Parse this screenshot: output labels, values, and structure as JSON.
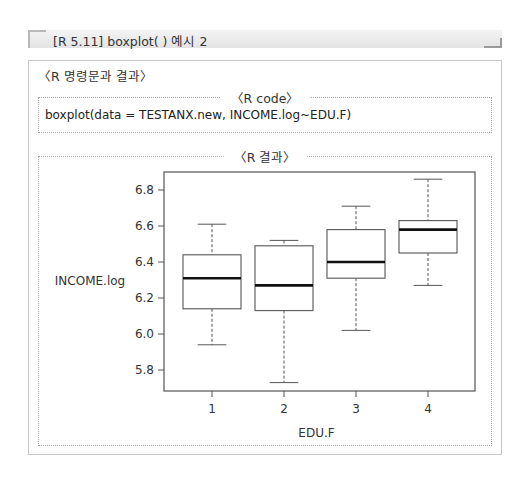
{
  "header": {
    "title": "[R 5.11] boxplot( ) 예시 2"
  },
  "panel": {
    "section_label": "〈R 명령문과 결과〉",
    "code_section": {
      "legend": "〈R code〉",
      "code": "boxplot(data = TESTANX.new, INCOME.log~EDU.F)"
    },
    "result_section": {
      "legend": "〈R 결과〉"
    }
  },
  "chart_data": {
    "type": "boxplot",
    "title": "",
    "xlabel": "EDU.F",
    "ylabel": "INCOME.log",
    "categories": [
      "1",
      "2",
      "3",
      "4"
    ],
    "yticks": [
      "5.8",
      "6.0",
      "6.2",
      "6.4",
      "6.6",
      "6.8"
    ],
    "ylim": [
      5.7,
      6.9
    ],
    "grid": false,
    "boxes": [
      {
        "category": "1",
        "whisker_low": 5.94,
        "q1": 6.14,
        "median": 6.31,
        "q3": 6.44,
        "whisker_high": 6.61
      },
      {
        "category": "2",
        "whisker_low": 5.73,
        "q1": 6.13,
        "median": 6.27,
        "q3": 6.49,
        "whisker_high": 6.52
      },
      {
        "category": "3",
        "whisker_low": 6.02,
        "q1": 6.31,
        "median": 6.4,
        "q3": 6.58,
        "whisker_high": 6.71
      },
      {
        "category": "4",
        "whisker_low": 6.27,
        "q1": 6.45,
        "median": 6.58,
        "q3": 6.63,
        "whisker_high": 6.86
      }
    ]
  }
}
